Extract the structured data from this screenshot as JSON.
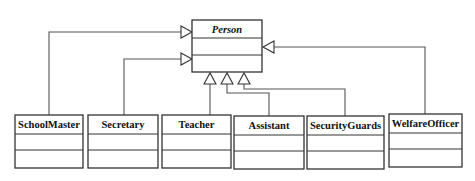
{
  "diagram": {
    "type": "uml-class-diagram",
    "relationship": "generalization",
    "superclass": {
      "name": "Person",
      "abstract": true,
      "attributes": [],
      "operations": []
    },
    "subclasses": [
      {
        "name": "SchoolMaster",
        "attributes": [],
        "operations": []
      },
      {
        "name": "Secretary",
        "attributes": [],
        "operations": []
      },
      {
        "name": "Teacher",
        "attributes": [],
        "operations": []
      },
      {
        "name": "Assistant",
        "attributes": [],
        "operations": []
      },
      {
        "name": "SecurityGuards",
        "attributes": [],
        "operations": []
      },
      {
        "name": "WelfareOfficer",
        "attributes": [],
        "operations": []
      }
    ],
    "edges": [
      {
        "from": "SchoolMaster",
        "to": "Person",
        "kind": "inheritance"
      },
      {
        "from": "Secretary",
        "to": "Person",
        "kind": "inheritance"
      },
      {
        "from": "Teacher",
        "to": "Person",
        "kind": "inheritance"
      },
      {
        "from": "Assistant",
        "to": "Person",
        "kind": "inheritance"
      },
      {
        "from": "SecurityGuards",
        "to": "Person",
        "kind": "inheritance"
      },
      {
        "from": "WelfareOfficer",
        "to": "Person",
        "kind": "inheritance"
      }
    ]
  }
}
